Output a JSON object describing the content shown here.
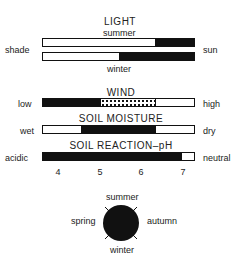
{
  "light": {
    "title": "LIGHT",
    "left_label": "shade",
    "right_label": "sun",
    "summer_label": "summer",
    "winter_label": "winter",
    "summer_bar": {
      "black_from_pct": 74,
      "black_to_pct": 100
    },
    "winter_bar": {
      "black_from_pct": 50,
      "black_to_pct": 100
    }
  },
  "wind": {
    "title": "WIND",
    "left_label": "low",
    "right_label": "high",
    "black_pct": [
      0,
      38
    ],
    "dotted_pct": [
      38,
      75
    ]
  },
  "soil_moisture": {
    "title": "SOIL MOISTURE",
    "left_label": "wet",
    "right_label": "dry",
    "black_pct": [
      25,
      75
    ]
  },
  "soil_ph": {
    "title": "SOIL REACTION–pH",
    "left_label": "acidic",
    "right_label": "neutral",
    "black_pct": [
      0,
      92
    ],
    "ticks": [
      "4",
      "5",
      "6",
      "7"
    ]
  },
  "seasons": {
    "top": "summer",
    "bottom": "winter",
    "left": "spring",
    "right": "autumn"
  },
  "colors": {
    "ink": "#111111",
    "paper": "#ffffff"
  }
}
